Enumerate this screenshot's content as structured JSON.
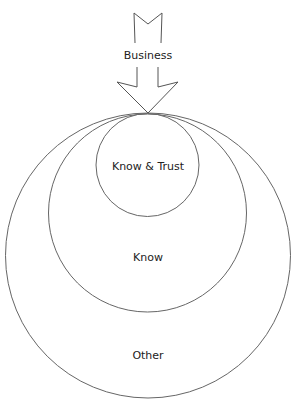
{
  "diagram": {
    "type": "nested-circles-with-arrow",
    "arrow": {
      "label": "Business",
      "direction": "down"
    },
    "circles": [
      {
        "id": "outer",
        "label": "Other"
      },
      {
        "id": "middle",
        "label": "Know"
      },
      {
        "id": "inner",
        "label": "Know & Trust"
      }
    ],
    "colors": {
      "stroke": "#555555",
      "text": "#222222",
      "background": "#ffffff"
    }
  }
}
